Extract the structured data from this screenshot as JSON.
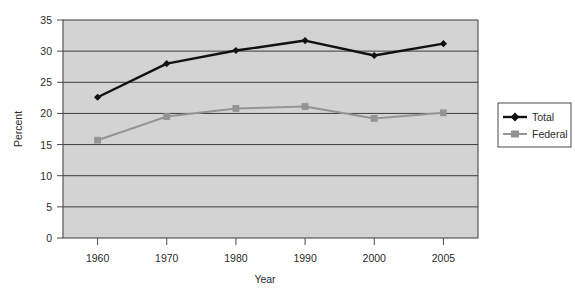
{
  "chart_data": {
    "type": "line",
    "title": "",
    "subtitle": "",
    "xlabel": "Year",
    "ylabel": "Percent",
    "categories": [
      "1960",
      "1970",
      "1980",
      "1990",
      "2000",
      "2005"
    ],
    "series": [
      {
        "name": "Total",
        "color": "#111111",
        "marker": "diamond",
        "values": [
          22.6,
          28.0,
          30.1,
          31.7,
          29.3,
          31.2
        ]
      },
      {
        "name": "Federal",
        "color": "#949494",
        "marker": "square",
        "values": [
          15.7,
          19.5,
          20.8,
          21.1,
          19.2,
          20.1
        ]
      }
    ],
    "ylim": [
      0,
      35
    ],
    "yticks": [
      "0",
      "5",
      "10",
      "15",
      "20",
      "25",
      "30",
      "35"
    ],
    "ytick_values": [
      0,
      5,
      10,
      15,
      20,
      25,
      30,
      35
    ],
    "xtick_labels": [
      "1960",
      "1970",
      "1980",
      "1990",
      "2000",
      "2005"
    ],
    "grid": "horizontal",
    "legend_position": "right",
    "plot_background": "#d3d3d3",
    "figure_background": "#ffffff"
  },
  "legend": {
    "entries": [
      {
        "label": "Total"
      },
      {
        "label": "Federal"
      }
    ]
  },
  "axes": {
    "y_title": "Percent",
    "x_title": "Year"
  }
}
